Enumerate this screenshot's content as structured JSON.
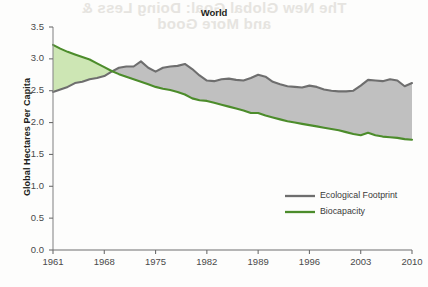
{
  "page": {
    "bleed_through_text_line1": "The New Global Goal: Doing Less &",
    "bleed_through_text_line2": "and More Good"
  },
  "chart_data": {
    "type": "area",
    "title": "World",
    "xlabel": "",
    "ylabel": "Global Hectares Per Capita",
    "xlim": [
      1961,
      2010
    ],
    "ylim": [
      0.0,
      3.5
    ],
    "grid": false,
    "legend_position": "inside-right-middle",
    "ytick_labels": [
      "0.0",
      "0.5",
      "1.0",
      "1.5",
      "2.0",
      "2.5",
      "3.0",
      "3.5"
    ],
    "ytick_values": [
      0.0,
      0.5,
      1.0,
      1.5,
      2.0,
      2.5,
      3.0,
      3.5
    ],
    "xtick_labels": [
      "1961",
      "1968",
      "1975",
      "1982",
      "1989",
      "1996",
      "2003",
      "2010"
    ],
    "xtick_values": [
      1961,
      1968,
      1975,
      1982,
      1989,
      1996,
      2003,
      2010
    ],
    "x": [
      1961,
      1962,
      1963,
      1964,
      1965,
      1966,
      1967,
      1968,
      1969,
      1970,
      1971,
      1972,
      1973,
      1974,
      1975,
      1976,
      1977,
      1978,
      1979,
      1980,
      1981,
      1982,
      1983,
      1984,
      1985,
      1986,
      1987,
      1988,
      1989,
      1990,
      1991,
      1992,
      1993,
      1994,
      1995,
      1996,
      1997,
      1998,
      1999,
      2000,
      2001,
      2002,
      2003,
      2004,
      2005,
      2006,
      2007,
      2008,
      2009,
      2010
    ],
    "series": [
      {
        "name": "Ecological Footprint",
        "color": "#6e6e6e",
        "fill_color": "#c0c0c0",
        "values": [
          2.48,
          2.52,
          2.56,
          2.62,
          2.64,
          2.68,
          2.7,
          2.73,
          2.8,
          2.86,
          2.88,
          2.88,
          2.96,
          2.86,
          2.8,
          2.86,
          2.88,
          2.89,
          2.92,
          2.84,
          2.74,
          2.66,
          2.65,
          2.68,
          2.69,
          2.67,
          2.66,
          2.7,
          2.75,
          2.72,
          2.64,
          2.6,
          2.57,
          2.56,
          2.55,
          2.58,
          2.56,
          2.52,
          2.5,
          2.49,
          2.49,
          2.5,
          2.58,
          2.67,
          2.66,
          2.65,
          2.68,
          2.66,
          2.57,
          2.62
        ]
      },
      {
        "name": "Biocapacity",
        "color": "#4c8c2b",
        "fill_color": "#cde6b4",
        "values": [
          3.22,
          3.16,
          3.11,
          3.07,
          3.03,
          2.99,
          2.93,
          2.87,
          2.81,
          2.76,
          2.72,
          2.68,
          2.64,
          2.6,
          2.56,
          2.53,
          2.51,
          2.48,
          2.44,
          2.38,
          2.35,
          2.34,
          2.31,
          2.28,
          2.25,
          2.22,
          2.19,
          2.15,
          2.15,
          2.11,
          2.08,
          2.05,
          2.02,
          2.0,
          1.98,
          1.96,
          1.94,
          1.92,
          1.9,
          1.88,
          1.85,
          1.82,
          1.8,
          1.84,
          1.8,
          1.78,
          1.77,
          1.76,
          1.74,
          1.73
        ]
      }
    ],
    "shaded_regions": [
      {
        "name": "ecological-reserve",
        "color": "#cde6b4",
        "description": "biocapacity above footprint"
      },
      {
        "name": "ecological-deficit",
        "color": "#c0c0c0",
        "description": "footprint above biocapacity"
      }
    ]
  }
}
